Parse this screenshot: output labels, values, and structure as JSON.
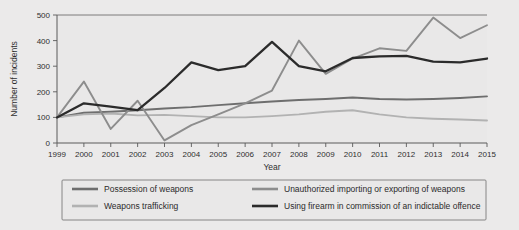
{
  "chart_data": {
    "type": "line",
    "title": "",
    "xlabel": "Year",
    "ylabel": "Number of incidents",
    "x": [
      1999,
      2000,
      2001,
      2002,
      2003,
      2004,
      2005,
      2006,
      2007,
      2008,
      2009,
      2010,
      2011,
      2012,
      2013,
      2014,
      2015
    ],
    "xtick_labels": [
      "1999",
      "2000",
      "2001",
      "2002",
      "2003",
      "2004",
      "2005",
      "2006",
      "2007",
      "2008",
      "2009",
      "2010",
      "2011",
      "2012",
      "2013",
      "2014",
      "2015"
    ],
    "ytick_labels": [
      "0",
      "100",
      "200",
      "300",
      "400",
      "500"
    ],
    "yticks": [
      0,
      100,
      200,
      300,
      400,
      500
    ],
    "ylim": [
      0,
      500
    ],
    "xlim": [
      1999,
      2015
    ],
    "grid": false,
    "legend_position": "bottom",
    "series": [
      {
        "name": "Possession of weapons",
        "color": "#6e6e6e",
        "values": [
          100,
          118,
          122,
          128,
          135,
          140,
          148,
          155,
          162,
          168,
          172,
          178,
          172,
          170,
          172,
          176,
          182
        ]
      },
      {
        "name": "Weapons trafficking",
        "color": "#b2b2b2",
        "values": [
          100,
          112,
          115,
          108,
          110,
          105,
          100,
          100,
          105,
          112,
          122,
          128,
          112,
          100,
          95,
          92,
          88
        ]
      },
      {
        "name": "Unauthorized importing or exporting of weapons",
        "color": "#8d8d8d",
        "values": [
          100,
          240,
          55,
          165,
          10,
          70,
          112,
          155,
          205,
          400,
          270,
          330,
          370,
          360,
          490,
          410,
          460
        ]
      },
      {
        "name": "Using firearm in commission of an indictable offence",
        "color": "#2b2b2b",
        "values": [
          100,
          155,
          142,
          128,
          215,
          315,
          285,
          300,
          395,
          300,
          280,
          332,
          338,
          340,
          318,
          315,
          330
        ]
      }
    ],
    "legend_entries": [
      {
        "label": "Possession of weapons",
        "color": "#6e6e6e"
      },
      {
        "label": "Unauthorized importing or exporting of weapons",
        "color": "#8d8d8d"
      },
      {
        "label": "Weapons trafficking",
        "color": "#b2b2b2"
      },
      {
        "label": "Using firearm in commission of an indictable offence",
        "color": "#2b2b2b"
      }
    ]
  },
  "colors": {
    "background": "#ebeaea",
    "plot_background": "#e9e8e8",
    "axis": "#5a5a5a",
    "frame": "#6f6f6f",
    "text": "#2f2f2f"
  }
}
